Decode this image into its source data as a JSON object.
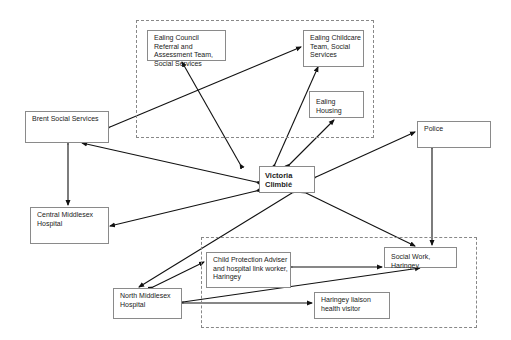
{
  "groups": [
    {
      "id": "ealing",
      "label": "Ealing agencies (dashed group)"
    },
    {
      "id": "haringey",
      "label": "Haringey agencies (dashed group)"
    }
  ],
  "nodes": {
    "victoria": "Victoria Climbié",
    "ealing_referral": "Ealing Council Referral and Assessment Team, Social Services",
    "ealing_childcare": "Ealing Childcare Team, Social Services",
    "ealing_housing": "Ealing Housing",
    "brent": "Brent Social Services",
    "central_middlesex": "Central Middlesex Hospital",
    "police": "Police",
    "child_protection": "Child Protection Adviser and hospital link worker, Haringey",
    "social_work": "Social Work, Haringey",
    "north_middlesex": "North Middlesex Hospital",
    "liaison_visitor": "Haringey liaison health visitor"
  },
  "edges": [
    {
      "from": "victoria",
      "to": "ealing_referral",
      "type": "bidirectional"
    },
    {
      "from": "victoria",
      "to": "ealing_childcare",
      "type": "bidirectional"
    },
    {
      "from": "victoria",
      "to": "ealing_housing",
      "type": "bidirectional"
    },
    {
      "from": "brent",
      "to": "ealing_childcare",
      "type": "bidirectional"
    },
    {
      "from": "victoria",
      "to": "brent",
      "type": "bidirectional"
    },
    {
      "from": "brent",
      "to": "central_middlesex",
      "type": "bidirectional"
    },
    {
      "from": "victoria",
      "to": "central_middlesex",
      "type": "bidirectional"
    },
    {
      "from": "victoria",
      "to": "police",
      "type": "bidirectional"
    },
    {
      "from": "police",
      "to": "social_work",
      "type": "bidirectional"
    },
    {
      "from": "victoria",
      "to": "social_work",
      "type": "bidirectional"
    },
    {
      "from": "victoria",
      "to": "north_middlesex",
      "type": "bidirectional"
    },
    {
      "from": "north_middlesex",
      "to": "child_protection",
      "type": "bidirectional"
    },
    {
      "from": "child_protection",
      "to": "social_work",
      "type": "bidirectional"
    },
    {
      "from": "north_middlesex",
      "to": "social_work",
      "type": "bidirectional"
    },
    {
      "from": "north_middlesex",
      "to": "liaison_visitor",
      "type": "bidirectional"
    }
  ]
}
